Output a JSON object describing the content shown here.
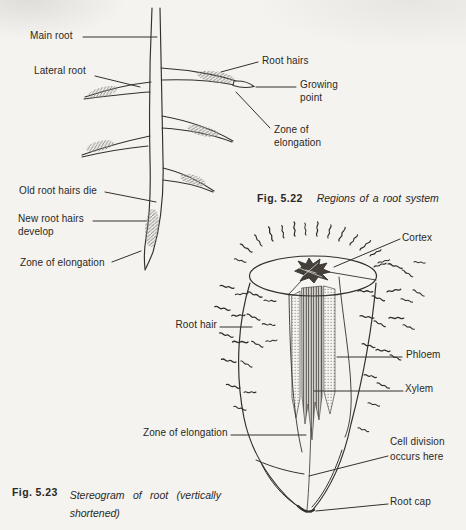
{
  "figure_522": {
    "labels": {
      "main_root": "Main root",
      "lateral_root": "Lateral root",
      "root_hairs": "Root hairs",
      "growing_point": "Growing\npoint",
      "zone_of_elongation_right": "Zone of\nelongation",
      "old_root_hairs_die": "Old root hairs die",
      "new_root_hairs_develop": "New root hairs\ndevelop",
      "zone_of_elongation_left": "Zone of elongation"
    },
    "caption": {
      "number": "Fig. 5.22",
      "title": "Regions of a root system"
    }
  },
  "figure_523": {
    "labels": {
      "cortex": "Cortex",
      "root_hair": "Root hair",
      "phloem": "Phloem",
      "xylem": "Xylem",
      "zone_of_elongation": "Zone of elongation",
      "cell_division_occurs_here": "Cell division\noccurs here",
      "root_cap": "Root cap"
    },
    "caption": {
      "number": "Fig. 5.23",
      "title": "Stereogram of root (vertically\nshortened)"
    }
  },
  "colors": {
    "paper": "#f5f3ef",
    "ink": "#34312c",
    "hair_fuzz": "#8b8b88"
  }
}
